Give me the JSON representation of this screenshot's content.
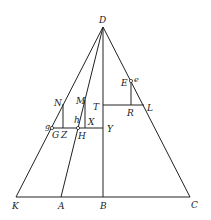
{
  "diagram": {
    "type": "geometric-construction",
    "points": {
      "D": {
        "label": "D",
        "x": 103,
        "y": 27
      },
      "K": {
        "label": "K",
        "x": 16,
        "y": 197
      },
      "A": {
        "label": "A",
        "x": 61,
        "y": 197
      },
      "B": {
        "label": "B",
        "x": 103,
        "y": 197
      },
      "C": {
        "label": "C",
        "x": 190,
        "y": 197
      },
      "N": {
        "label": "N",
        "x": 63,
        "y": 104
      },
      "M": {
        "label": "M",
        "x": 85,
        "y": 100
      },
      "T": {
        "label": "T",
        "x": 103,
        "y": 105
      },
      "L": {
        "label": "L",
        "x": 144,
        "y": 105
      },
      "E": {
        "label": "E",
        "x": 131,
        "y": 81
      },
      "e": {
        "label": "e"
      },
      "R": {
        "label": "R",
        "x": 131,
        "y": 105
      },
      "g": {
        "label": "g",
        "x": 51,
        "y": 128
      },
      "G": {
        "label": "G"
      },
      "Z": {
        "label": "Z",
        "x": 63,
        "y": 128
      },
      "h": {
        "label": "h"
      },
      "H": {
        "label": "H",
        "x": 78,
        "y": 128
      },
      "X": {
        "label": "X",
        "x": 85,
        "y": 128
      },
      "Y": {
        "label": "Y",
        "x": 103,
        "y": 128
      }
    },
    "labels": [
      "D",
      "N",
      "M",
      "T",
      "E",
      "e",
      "L",
      "R",
      "g",
      "G",
      "Z",
      "h",
      "H",
      "X",
      "Y",
      "K",
      "A",
      "B",
      "C"
    ]
  }
}
